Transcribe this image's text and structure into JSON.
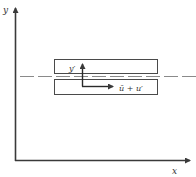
{
  "diagram": {
    "axes": {
      "y_label": "y",
      "x_label": "x"
    },
    "labels": {
      "fluctuation_y": "y′",
      "velocity": "ū + u′"
    },
    "colors": {
      "stroke": "#3a3a3a",
      "dashed": "#8a8a8a",
      "text": "#333333",
      "background": "#ffffff"
    }
  }
}
